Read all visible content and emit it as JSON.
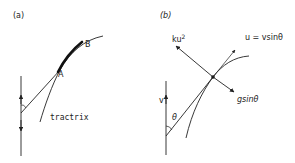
{
  "panels": [
    {
      "id": "a",
      "label": "(a)",
      "point_a": "A",
      "point_b": "B",
      "curve_label": "tractrix"
    },
    {
      "id": "b",
      "label": "(b)",
      "velocity_label": "v",
      "angle_label": "θ",
      "drag_force_label": "ku",
      "drag_force_exponent": "2",
      "tangential_velocity_label": "u = vsinθ",
      "gravity_component_label": "gsinθ"
    }
  ],
  "colors": {
    "stroke": "#222222",
    "background": "#ffffff"
  }
}
